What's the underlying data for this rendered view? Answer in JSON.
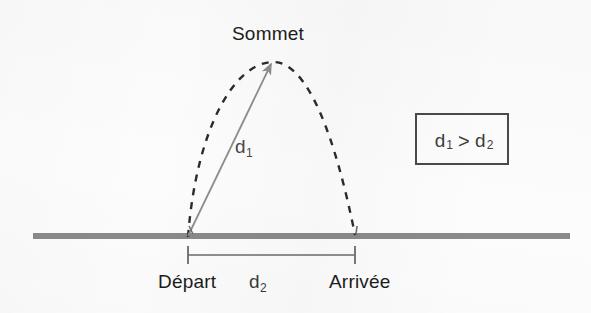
{
  "diagram": {
    "type": "projectile-trajectory-diagram",
    "language": "fr",
    "apex_label": "Sommet",
    "start_label": "Départ",
    "end_label": "Arrivée",
    "distance_slant_label": "d",
    "distance_slant_sub": "1",
    "distance_ground_label": "d",
    "distance_ground_sub": "2",
    "comparison": {
      "left_symbol": "d",
      "left_sub": "1",
      "operator": ">",
      "right_symbol": "d",
      "right_sub": "2"
    },
    "colors": {
      "ground": "#8a8a8a",
      "trajectory": "#2b2b2b",
      "arrow": "#8d8d8d",
      "text": "#1b1b1b",
      "box_border": "#4a4a4a",
      "background": "#fcfcfc"
    },
    "geometry": {
      "ground_y": 236,
      "ground_x_start": 33,
      "ground_x_end": 570,
      "start_point_x": 188,
      "end_point_x": 355,
      "apex_x": 272,
      "apex_y": 62,
      "dimension_bar_y": 255
    }
  }
}
